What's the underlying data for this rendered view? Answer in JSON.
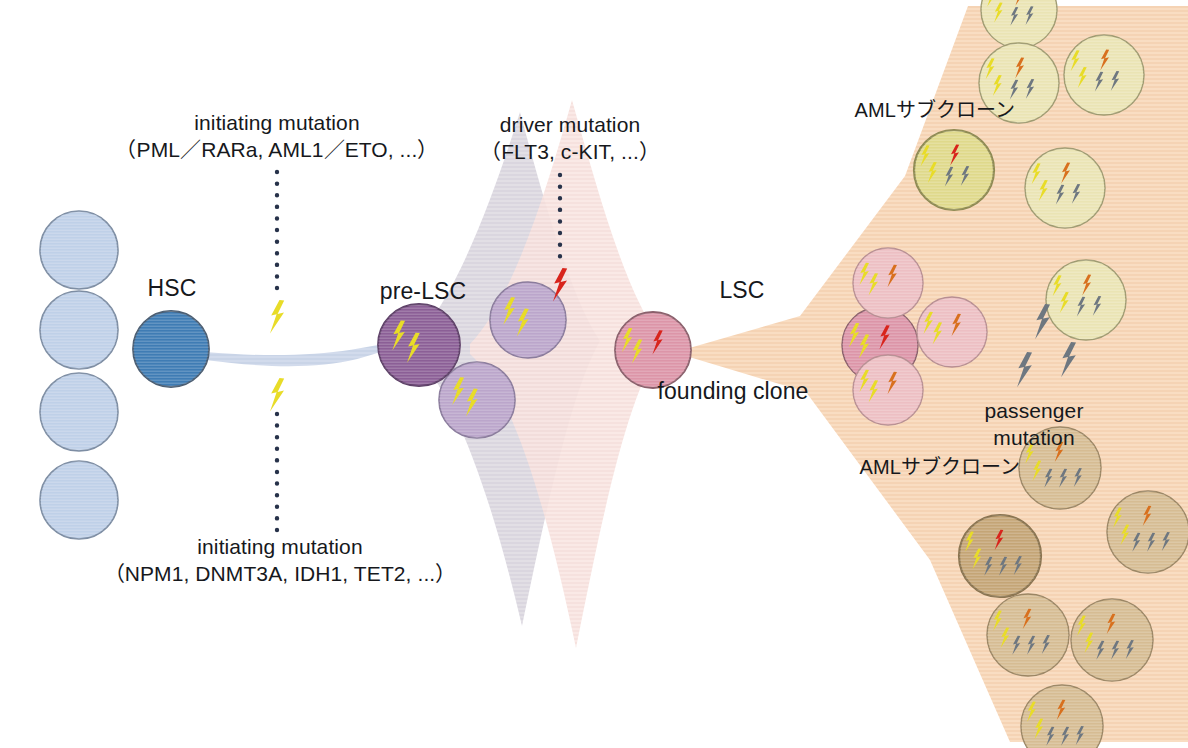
{
  "diagram": {
    "background_color": "#ffffff"
  },
  "labels": {
    "initiating_top": {
      "line1": "initiating mutation",
      "line2": "（PML／RARa, AML1／ETO, ...）"
    },
    "initiating_bottom": {
      "line1": "initiating mutation",
      "line2": "（NPM1, DNMT3A, IDH1, TET2, ...）"
    },
    "driver": {
      "line1": "driver mutation",
      "line2": "（FLT3, c-KIT, ...）"
    },
    "passenger": {
      "line1": "passenger",
      "line2": "mutation"
    },
    "hsc": "HSC",
    "pre_lsc": "pre-LSC",
    "lsc": "LSC",
    "founding_clone": "founding clone",
    "aml_subclone_top": "AMLサブクローン",
    "aml_subclone_bottom": "AMLサブクローン"
  },
  "colors": {
    "hsc_fill": "#3f7cb4",
    "hsc_stroke": "#4a5d72",
    "progenitor_fill": "#bfd0e8",
    "progenitor_stroke": "#7d8da3",
    "pre_lsc_fill": "#8b5f96",
    "pre_lsc_stroke": "#5e4068",
    "pre_lsc_daughter_fill": "#bba6cb",
    "pre_lsc_daughter_stroke": "#8a7b9c",
    "lsc_fill": "#dc95a8",
    "lsc_stroke": "#8a5f6b",
    "pink_clone_fill": "#edbfc3",
    "pink_clone_stroke": "#b78e92",
    "yellow_clone_fill": "#dfd98b",
    "yellow_clone_stroke": "#8e8a52",
    "pale_yellow_clone_fill": "#eae4b4",
    "pale_yellow_clone_stroke": "#9e9a70",
    "tan_clone_fill": "#c4a576",
    "tan_clone_stroke": "#8a7450",
    "pale_tan_clone_fill": "#d6bc93",
    "pale_tan_clone_stroke": "#9a8563",
    "fan_peach": "#f7d9bc",
    "fan_gray": "#ddd9e2",
    "fan_pink": "#f7e2e0",
    "band_blue": "#ccd6e8",
    "bolt_yellow": "#e8dc28",
    "bolt_red": "#d8241c",
    "bolt_orange": "#d8701e",
    "bolt_gray": "#6e7780",
    "dotted_line": "#27324a",
    "text": "#16181c"
  },
  "cells": {
    "progenitors": [
      {
        "cx": 79,
        "cy": 250,
        "r": 39
      },
      {
        "cx": 79,
        "cy": 330,
        "r": 39
      },
      {
        "cx": 79,
        "cy": 412,
        "r": 39
      },
      {
        "cx": 79,
        "cy": 500,
        "r": 39
      }
    ],
    "hsc": {
      "cx": 171,
      "cy": 349,
      "r": 38
    },
    "pre_lsc": {
      "cx": 419,
      "cy": 345,
      "r": 41,
      "bolts": [
        "yellow",
        "yellow"
      ]
    },
    "pre_lsc_daughters": [
      {
        "cx": 528,
        "cy": 320,
        "r": 38,
        "bolts": [
          "yellow",
          "yellow"
        ]
      },
      {
        "cx": 477,
        "cy": 400,
        "r": 38,
        "bolts": [
          "yellow",
          "yellow"
        ]
      }
    ],
    "lsc": {
      "cx": 653,
      "cy": 350,
      "r": 38,
      "bolts": [
        "yellow",
        "yellow",
        "red"
      ]
    },
    "founding_descendants": [
      {
        "cx": 880,
        "cy": 345,
        "r": 38,
        "tone": "lsc",
        "bolts": [
          "yellow",
          "yellow",
          "red"
        ]
      },
      {
        "cx": 888,
        "cy": 283,
        "r": 35,
        "tone": "pink",
        "bolts": [
          "yellow",
          "yellow",
          "orange"
        ]
      },
      {
        "cx": 952,
        "cy": 332,
        "r": 35,
        "tone": "pink",
        "bolts": [
          "yellow",
          "yellow",
          "orange"
        ]
      },
      {
        "cx": 888,
        "cy": 390,
        "r": 35,
        "tone": "pink",
        "bolts": [
          "yellow",
          "yellow",
          "orange"
        ]
      }
    ],
    "top_subclones": [
      {
        "cx": 954,
        "cy": 170,
        "r": 40,
        "tone": "yellow",
        "outlined": true,
        "bolts": [
          "yellow",
          "yellow",
          "red",
          "gray",
          "gray"
        ]
      },
      {
        "cx": 1019,
        "cy": 10,
        "r": 38,
        "tone": "pale_yellow",
        "outlined": false,
        "bolts": [
          "yellow",
          "yellow",
          "orange",
          "gray",
          "gray"
        ]
      },
      {
        "cx": 1019,
        "cy": 83,
        "r": 40,
        "tone": "pale_yellow",
        "outlined": false,
        "bolts": [
          "yellow",
          "yellow",
          "orange",
          "gray",
          "gray"
        ]
      },
      {
        "cx": 1104,
        "cy": 75,
        "r": 40,
        "tone": "pale_yellow",
        "outlined": false,
        "bolts": [
          "yellow",
          "yellow",
          "orange",
          "gray",
          "gray"
        ]
      },
      {
        "cx": 1065,
        "cy": 188,
        "r": 40,
        "tone": "pale_yellow",
        "outlined": false,
        "bolts": [
          "yellow",
          "yellow",
          "orange",
          "gray",
          "gray"
        ]
      },
      {
        "cx": 1086,
        "cy": 300,
        "r": 40,
        "tone": "pale_yellow",
        "outlined": false,
        "bolts": [
          "yellow",
          "yellow",
          "orange",
          "gray",
          "gray"
        ]
      }
    ],
    "bottom_subclones": [
      {
        "cx": 1000,
        "cy": 556,
        "r": 41,
        "tone": "tan",
        "outlined": true,
        "bolts": [
          "yellow",
          "yellow",
          "red",
          "gray",
          "gray",
          "gray"
        ]
      },
      {
        "cx": 1060,
        "cy": 468,
        "r": 41,
        "tone": "pale_tan",
        "outlined": false,
        "bolts": [
          "yellow",
          "yellow",
          "orange",
          "gray",
          "gray",
          "gray"
        ]
      },
      {
        "cx": 1148,
        "cy": 532,
        "r": 41,
        "tone": "pale_tan",
        "outlined": false,
        "bolts": [
          "yellow",
          "yellow",
          "orange",
          "gray",
          "gray",
          "gray"
        ]
      },
      {
        "cx": 1028,
        "cy": 635,
        "r": 41,
        "tone": "pale_tan",
        "outlined": false,
        "bolts": [
          "yellow",
          "yellow",
          "orange",
          "gray",
          "gray",
          "gray"
        ]
      },
      {
        "cx": 1112,
        "cy": 640,
        "r": 41,
        "tone": "pale_tan",
        "outlined": false,
        "bolts": [
          "yellow",
          "yellow",
          "orange",
          "gray",
          "gray",
          "gray"
        ]
      },
      {
        "cx": 1062,
        "cy": 726,
        "r": 41,
        "tone": "pale_tan",
        "outlined": false,
        "bolts": [
          "yellow",
          "yellow",
          "orange",
          "gray",
          "gray",
          "gray"
        ]
      }
    ]
  },
  "free_bolts": {
    "initiating_top": {
      "x": 277,
      "y": 300,
      "color": "yellow",
      "scale": 1.0
    },
    "initiating_bottom": {
      "x": 277,
      "y": 378,
      "color": "yellow",
      "scale": 1.0
    },
    "driver": {
      "x": 560,
      "y": 268,
      "color": "red",
      "scale": 1.0
    },
    "passenger": [
      {
        "x": 1042,
        "y": 304,
        "color": "gray",
        "scale": 1.05
      },
      {
        "x": 1024,
        "y": 352,
        "color": "gray",
        "scale": 1.05
      },
      {
        "x": 1068,
        "y": 342,
        "color": "gray",
        "scale": 1.05
      }
    ]
  },
  "dotted_lines": [
    {
      "x": 277,
      "y1": 172,
      "y2": 292,
      "name": "initiating-top-connector"
    },
    {
      "x": 277,
      "y1": 530,
      "y2": 404,
      "name": "initiating-bottom-connector"
    },
    {
      "x": 560,
      "y1": 175,
      "y2": 258,
      "name": "driver-connector"
    }
  ]
}
